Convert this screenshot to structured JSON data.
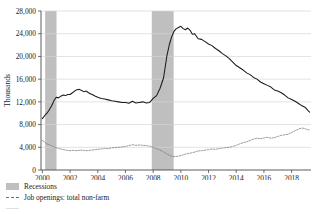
{
  "chart_data": {
    "type": "line",
    "title": "",
    "xlabel": "",
    "ylabel": "Thousands",
    "xlim": [
      1999.9,
      2019.4
    ],
    "ylim": [
      0,
      28000
    ],
    "ytick_labels": [
      "0",
      "4,000",
      "8,000",
      "12,000",
      "16,000",
      "20,000",
      "24,000",
      "28,000"
    ],
    "ytick_values": [
      0,
      4000,
      8000,
      12000,
      16000,
      20000,
      24000,
      28000
    ],
    "xtick_labels": [
      "2000",
      "2002",
      "2004",
      "2006",
      "2008",
      "2010",
      "2012",
      "2014",
      "2016",
      "2018"
    ],
    "xtick_values": [
      2000,
      2002,
      2004,
      2006,
      2008,
      2010,
      2012,
      2014,
      2016,
      2018
    ],
    "grid": "horizontal",
    "legend_position": "below-left",
    "colors": {
      "unemployment_line": "#1a1a1a",
      "openings_line": "#7a7a7a",
      "recession_band": "#bfbfbf",
      "gridline": "#d6d6d6",
      "axis": "#4a4a4a"
    },
    "shaded_regions": [
      {
        "name": "Recessions",
        "start": 2000.2,
        "end": 2001.02
      },
      {
        "name": "Recessions",
        "start": 2007.9,
        "end": 2009.48
      }
    ],
    "series": [
      {
        "name": "Unemployment level",
        "style": "solid",
        "color": "#1a1a1a",
        "x": [
          2000.0,
          2000.17,
          2000.33,
          2000.5,
          2000.67,
          2000.83,
          2001.0,
          2001.17,
          2001.33,
          2001.5,
          2001.67,
          2001.83,
          2002.0,
          2002.17,
          2002.33,
          2002.5,
          2002.67,
          2002.83,
          2003.0,
          2003.17,
          2003.33,
          2003.5,
          2003.67,
          2003.83,
          2004.0,
          2004.25,
          2004.5,
          2004.75,
          2005.0,
          2005.25,
          2005.5,
          2005.75,
          2006.0,
          2006.25,
          2006.5,
          2006.75,
          2007.0,
          2007.25,
          2007.5,
          2007.75,
          2008.0,
          2008.25,
          2008.5,
          2008.75,
          2009.0,
          2009.17,
          2009.33,
          2009.5,
          2009.67,
          2009.83,
          2010.0,
          2010.17,
          2010.33,
          2010.5,
          2010.67,
          2010.83,
          2011.0,
          2011.25,
          2011.5,
          2011.75,
          2012.0,
          2012.25,
          2012.5,
          2012.75,
          2013.0,
          2013.25,
          2013.5,
          2013.75,
          2014.0,
          2014.25,
          2014.5,
          2014.75,
          2015.0,
          2015.25,
          2015.5,
          2015.75,
          2016.0,
          2016.25,
          2016.5,
          2016.75,
          2017.0,
          2017.25,
          2017.5,
          2017.75,
          2018.0,
          2018.25,
          2018.5,
          2018.75,
          2019.0,
          2019.17,
          2019.3
        ],
        "y": [
          9050,
          9600,
          10000,
          10600,
          11300,
          12200,
          12800,
          12700,
          13000,
          13200,
          13100,
          13300,
          13300,
          13600,
          13900,
          14150,
          14200,
          14000,
          13800,
          13900,
          13600,
          13400,
          13200,
          13000,
          12800,
          12600,
          12500,
          12350,
          12200,
          12100,
          12000,
          11900,
          11900,
          11750,
          12100,
          11800,
          11900,
          12000,
          11800,
          11900,
          12600,
          13100,
          14400,
          16200,
          20200,
          22100,
          23400,
          24400,
          24900,
          25100,
          25300,
          24900,
          24700,
          25000,
          24600,
          23900,
          24000,
          23100,
          23000,
          22600,
          22200,
          21900,
          21400,
          21000,
          20500,
          20100,
          19600,
          19000,
          18400,
          18000,
          17600,
          17100,
          16800,
          16300,
          16000,
          15500,
          15200,
          14900,
          14600,
          14100,
          13900,
          13600,
          13200,
          12700,
          12400,
          12100,
          11700,
          11300,
          11000,
          10500,
          10200
        ]
      },
      {
        "name": "Job openings: total non-farm",
        "style": "dashed",
        "color": "#7a7a7a",
        "x": [
          2000.0,
          2000.17,
          2000.33,
          2000.5,
          2000.67,
          2000.83,
          2001.0,
          2001.17,
          2001.33,
          2001.5,
          2001.67,
          2001.83,
          2002.0,
          2002.25,
          2002.5,
          2002.75,
          2003.0,
          2003.25,
          2003.5,
          2003.75,
          2004.0,
          2004.25,
          2004.5,
          2004.75,
          2005.0,
          2005.25,
          2005.5,
          2005.75,
          2006.0,
          2006.25,
          2006.5,
          2006.75,
          2007.0,
          2007.25,
          2007.5,
          2007.75,
          2008.0,
          2008.25,
          2008.5,
          2008.75,
          2009.0,
          2009.25,
          2009.5,
          2009.75,
          2010.0,
          2010.25,
          2010.5,
          2010.75,
          2011.0,
          2011.25,
          2011.5,
          2011.75,
          2012.0,
          2012.25,
          2012.5,
          2012.75,
          2013.0,
          2013.25,
          2013.5,
          2013.75,
          2014.0,
          2014.25,
          2014.5,
          2014.75,
          2015.0,
          2015.25,
          2015.5,
          2015.75,
          2016.0,
          2016.25,
          2016.5,
          2016.75,
          2017.0,
          2017.25,
          2017.5,
          2017.75,
          2018.0,
          2018.25,
          2018.5,
          2018.75,
          2019.0,
          2019.17,
          2019.3
        ],
        "y": [
          5200,
          4900,
          4600,
          4450,
          4250,
          4050,
          3900,
          3800,
          3700,
          3600,
          3500,
          3450,
          3400,
          3450,
          3400,
          3500,
          3450,
          3400,
          3500,
          3550,
          3650,
          3700,
          3800,
          3750,
          3900,
          3950,
          4000,
          4050,
          4150,
          4300,
          4450,
          4350,
          4400,
          4350,
          4300,
          4200,
          4000,
          3800,
          3500,
          3200,
          2800,
          2500,
          2350,
          2400,
          2550,
          2750,
          2900,
          3000,
          3150,
          3350,
          3400,
          3500,
          3600,
          3700,
          3650,
          3750,
          3850,
          3950,
          4000,
          4150,
          4350,
          4600,
          4800,
          4950,
          5200,
          5450,
          5600,
          5500,
          5650,
          5750,
          5600,
          5700,
          5900,
          6100,
          6200,
          6300,
          6600,
          6900,
          7200,
          7400,
          7250,
          7100,
          7050
        ]
      }
    ]
  },
  "legend": {
    "items": [
      {
        "label": "Recessions",
        "marker": "recession-swatch"
      },
      {
        "label": "Job openings: total non-farm",
        "marker": "dashed-line-swatch"
      },
      {
        "label": "",
        "marker": "solid-line-swatch"
      }
    ]
  }
}
